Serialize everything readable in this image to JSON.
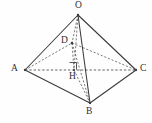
{
  "figure": {
    "kind": "geometry-diagram",
    "canvas": {
      "width": 152,
      "height": 123,
      "background": "#ffffff"
    },
    "stroke_colors": {
      "solid_edge": "#3a3a3a",
      "hidden_edge": "#4a4a4a",
      "label_text": "#2e2e2e"
    },
    "vertices": [
      {
        "id": "O",
        "label": "O",
        "x": 78,
        "y": 15,
        "label_x": 75,
        "label_y": 1,
        "type": "apex"
      },
      {
        "id": "A",
        "label": "A",
        "x": 25,
        "y": 70,
        "label_x": 11,
        "label_y": 64,
        "type": "base"
      },
      {
        "id": "C",
        "label": "C",
        "x": 136,
        "y": 70,
        "label_x": 140,
        "label_y": 64,
        "type": "base"
      },
      {
        "id": "B",
        "label": "B",
        "x": 90,
        "y": 103,
        "label_x": 86,
        "label_y": 107,
        "type": "base"
      },
      {
        "id": "D",
        "label": "D",
        "x": 72,
        "y": 43,
        "label_x": 61,
        "label_y": 36,
        "type": "interior"
      },
      {
        "id": "H",
        "label": "H",
        "x": 74,
        "y": 70,
        "label_x": 69,
        "label_y": 72,
        "type": "foot-of-perpendicular"
      }
    ],
    "edges": [
      {
        "id": "AO",
        "from": "A",
        "to": "O",
        "style": "solid"
      },
      {
        "id": "OC",
        "from": "O",
        "to": "C",
        "style": "solid"
      },
      {
        "id": "OB",
        "from": "O",
        "to": "B",
        "style": "solid"
      },
      {
        "id": "AB",
        "from": "A",
        "to": "B",
        "style": "solid"
      },
      {
        "id": "BC",
        "from": "B",
        "to": "C",
        "style": "solid"
      },
      {
        "id": "AC",
        "from": "A",
        "to": "C",
        "style": "dashed"
      },
      {
        "id": "AD",
        "from": "A",
        "to": "D",
        "style": "dashed"
      },
      {
        "id": "DC",
        "from": "D",
        "to": "C",
        "style": "dashed"
      },
      {
        "id": "OD",
        "from": "O",
        "to": "D",
        "style": "dashed"
      },
      {
        "id": "DH",
        "from": "D",
        "to": "H",
        "style": "dashed"
      },
      {
        "id": "OH",
        "from": "O",
        "to": "H",
        "style": "dashed"
      },
      {
        "id": "DB",
        "from": "D",
        "to": "B",
        "style": "dashed"
      },
      {
        "id": "HB",
        "from": "H",
        "to": "B",
        "style": "dashed"
      }
    ],
    "markers": [
      {
        "id": "right-angle-at-H",
        "kind": "right-angle-square",
        "at": "H",
        "x": 70,
        "y": 61,
        "size": 7
      }
    ]
  }
}
